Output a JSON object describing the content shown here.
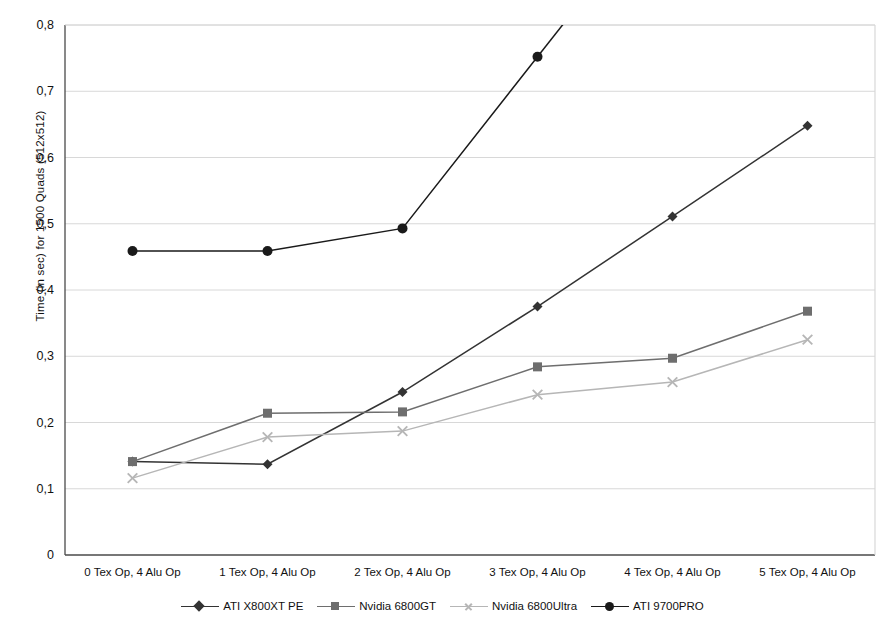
{
  "chart_data": {
    "type": "line",
    "title": "",
    "xlabel": "",
    "ylabel": "Time (in sec) for 1500 Quads (512x512)",
    "categories": [
      "0 Tex Op, 4 Alu Op",
      "1 Tex Op, 4 Alu Op",
      "2 Tex Op, 4 Alu Op",
      "3 Tex Op, 4 Alu Op",
      "4 Tex Op, 4 Alu Op",
      "5 Tex Op, 4 Alu Op"
    ],
    "yticks": [
      "0",
      "0,1",
      "0,2",
      "0,3",
      "0,4",
      "0,5",
      "0,6",
      "0,7",
      "0,8"
    ],
    "ytick_values": [
      0,
      0.1,
      0.2,
      0.3,
      0.4,
      0.5,
      0.6,
      0.7,
      0.8
    ],
    "ylim": [
      0,
      0.8
    ],
    "grid": true,
    "legend_position": "bottom",
    "series": [
      {
        "name": "ATI X800XT PE",
        "marker": "diamond",
        "color": "#333333",
        "values": [
          0.141,
          0.137,
          0.246,
          0.375,
          0.511,
          0.648
        ]
      },
      {
        "name": "Nvidia 6800GT",
        "marker": "square",
        "color": "#6e6e6e",
        "values": [
          0.141,
          0.214,
          0.216,
          0.284,
          0.297,
          0.368
        ]
      },
      {
        "name": "Nvidia 6800Ultra",
        "marker": "x",
        "color": "#b6b6b6",
        "values": [
          0.116,
          0.178,
          0.187,
          0.242,
          0.261,
          0.325
        ]
      },
      {
        "name": "ATI 9700PRO",
        "marker": "circle",
        "color": "#1a1a1a",
        "values": [
          0.459,
          0.459,
          0.493,
          0.752,
          null,
          null
        ]
      }
    ]
  },
  "colors": {
    "axis": "#4a4a4a",
    "grid": "#d8d8d8",
    "background": "#ffffff",
    "text": "#111111"
  }
}
